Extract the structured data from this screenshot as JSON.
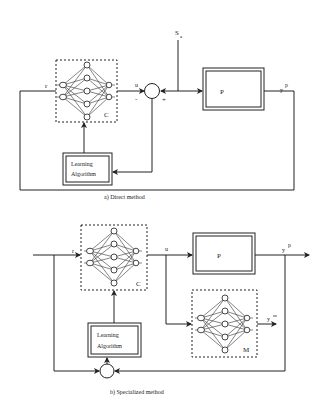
{
  "diagrams": [
    {
      "id": "direct",
      "caption": "a) Direct   method",
      "blocks": {
        "controller": {
          "label": "C"
        },
        "plant": {
          "label": "P"
        },
        "learning": {
          "line1": "Learning",
          "line2": "Algorithm"
        }
      },
      "signals": {
        "reference": "r",
        "control": "u",
        "disturbance_main": "S",
        "disturbance_sub": "a",
        "output_main": "y",
        "output_sup": "p",
        "minus": "-",
        "plus": "+"
      }
    },
    {
      "id": "specialized",
      "caption": "b) Specialized   method",
      "blocks": {
        "controller": {
          "label": "C"
        },
        "plant": {
          "label": "P"
        },
        "model": {
          "label": "M"
        },
        "learning": {
          "line1": "Learning",
          "line2": "Algorithm"
        }
      },
      "signals": {
        "reference": "r",
        "control": "u",
        "output_main": "y",
        "output_sup": "p",
        "model_output_main": "y",
        "model_output_sup": "m"
      }
    }
  ],
  "colors": {
    "line": "#222222",
    "background": "#ffffff"
  }
}
